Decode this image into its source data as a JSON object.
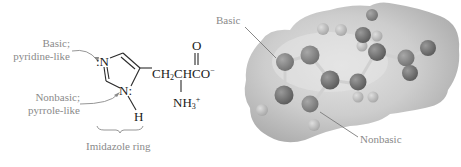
{
  "left_panel": {
    "labels": {
      "basic_line1": "Basic;",
      "basic_line2": "pyridine-like",
      "nonbasic_line1": "Nonbasic;",
      "nonbasic_line2": "pyrrole-like",
      "ring_caption": "Imidazole ring"
    },
    "structure": {
      "n_top": ":N",
      "n_bottom": "N:",
      "h": "H",
      "o_top": "O",
      "chain_main": "CH",
      "chain_sub": "2",
      "chain_rest": "CHCO",
      "charge_minus": "−",
      "nh_main": "NH",
      "nh_sub": "3",
      "charge_plus": "+"
    }
  },
  "right_panel": {
    "labels": {
      "basic": "Basic",
      "nonbasic": "Nonbasic"
    },
    "colors": {
      "surface": "#b9b9b9",
      "surface_highlight": "#e2e2e2",
      "atom_dark": "#6e6e6e",
      "atom_light": "#b5b5b5",
      "pointer": "#7a7a7a"
    }
  }
}
